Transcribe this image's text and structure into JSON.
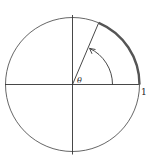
{
  "diagram": {
    "type": "unit-circle-angle",
    "angle_label": "θ",
    "radius_label": "1",
    "angle_degrees": 67,
    "colors": {
      "line": "#333333",
      "arc_highlight": "#555555",
      "background": "#ffffff"
    }
  }
}
